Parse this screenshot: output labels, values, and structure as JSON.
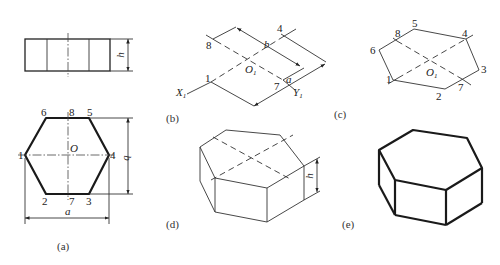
{
  "figure": {
    "panels": {
      "a": {
        "caption": "(a)",
        "front_view": {
          "dimension_label": "h"
        },
        "top_view": {
          "vertex_labels": [
            "1",
            "2",
            "3",
            "4",
            "5",
            "6",
            "7",
            "8"
          ],
          "center_label": "O",
          "width_label": "a",
          "height_label": "b"
        }
      },
      "b": {
        "caption": "(b)",
        "point_labels": [
          "8",
          "4",
          "1",
          "7"
        ],
        "center_label": "O",
        "center_sub": "1",
        "axis_x_label": "X",
        "axis_x_sub": "1",
        "axis_y_label": "Y",
        "axis_y_sub": "1",
        "dim_b": "b",
        "dim_a": "a"
      },
      "c": {
        "caption": "(c)",
        "vertex_labels": [
          "1",
          "2",
          "3",
          "4",
          "5",
          "6",
          "7",
          "8"
        ],
        "center_label": "O",
        "center_sub": "1"
      },
      "d": {
        "caption": "(d)",
        "dimension_label": "h"
      },
      "e": {
        "caption": "(e)"
      }
    }
  }
}
